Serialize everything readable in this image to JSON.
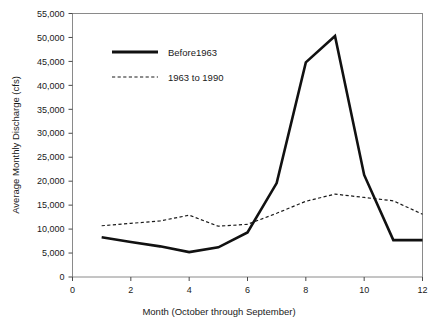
{
  "chart_data": {
    "type": "line",
    "title": "",
    "xlabel": "Month (October through September)",
    "ylabel": "Average Monthly Discharge (cfs)",
    "xlim": [
      0,
      12
    ],
    "ylim": [
      0,
      55000
    ],
    "grid": false,
    "legend_position": "upper-left-inside",
    "x_ticks": [
      0,
      2,
      4,
      6,
      8,
      10,
      12
    ],
    "x_tick_labels": [
      "0",
      "2",
      "4",
      "6",
      "8",
      "10",
      "12"
    ],
    "y_ticks": [
      0,
      5000,
      10000,
      15000,
      20000,
      25000,
      30000,
      35000,
      40000,
      45000,
      50000,
      55000
    ],
    "y_tick_labels": [
      "0",
      "5,000",
      "10,000",
      "15,000",
      "20,000",
      "25,000",
      "30,000",
      "35,000",
      "40,000",
      "45,000",
      "50,000",
      "55,000"
    ],
    "x": [
      1,
      2,
      3,
      4,
      5,
      6,
      7,
      8,
      9,
      10,
      11,
      12
    ],
    "series": [
      {
        "name": "Before1963",
        "style": "solid",
        "color": "#111111",
        "values": [
          8300,
          7300,
          6400,
          5200,
          6200,
          9300,
          19600,
          44800,
          50300,
          21300,
          7700,
          7700
        ]
      },
      {
        "name": "1963 to 1990",
        "style": "dashed",
        "color": "#1a1a1a",
        "values": [
          10700,
          11200,
          11700,
          12900,
          10600,
          11000,
          13300,
          15800,
          17300,
          16600,
          15900,
          13100
        ]
      }
    ]
  },
  "legend": {
    "entries": [
      {
        "label": "Before1963"
      },
      {
        "label": "1963 to 1990"
      }
    ]
  },
  "axes": {
    "x_title": "Month (October through September)",
    "y_title": "Average Monthly Discharge (cfs)"
  },
  "cut_title_fragment": ""
}
